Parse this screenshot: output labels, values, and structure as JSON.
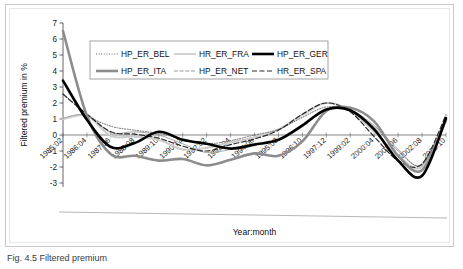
{
  "figure": {
    "caption": "Fig. 4.5   Filtered premium"
  },
  "chart_data": {
    "type": "line",
    "title": "",
    "xlabel": "Year:month",
    "ylabel": "Filtered premium in %",
    "ylim": [
      -3,
      7
    ],
    "yticks": [
      -3,
      -2,
      -1,
      0,
      1,
      2,
      3,
      4,
      5,
      6,
      7
    ],
    "ytick_labels": [
      "-3",
      "-2",
      "-1",
      "0",
      "1",
      "2",
      "3",
      "4",
      "5",
      "6",
      "7"
    ],
    "grid": false,
    "legend_position": "top-center",
    "x": [
      "1985:02",
      "1986:04",
      "1987:06",
      "1988:08",
      "1989:10",
      "1990:12",
      "1992:02",
      "1993:04",
      "1994:06",
      "1995:08",
      "1996:10",
      "1997:12",
      "1999:02",
      "2000:04",
      "2001:06",
      "2002:08",
      "2003:10"
    ],
    "xtick_labels": [
      "1985:02",
      "1986:04",
      "1987:06",
      "1988:08",
      "1989:10",
      "1990:12",
      "1992:02",
      "1993:04",
      "1994:06",
      "1995:08",
      "1996:10",
      "1997:12",
      "1999:02",
      "2000:04",
      "2001:06",
      "2002:08",
      "2003:10"
    ],
    "series": [
      {
        "name": "HP_ER_BEL",
        "style": "dotted",
        "color": "#6b6b6b",
        "width": 1,
        "values": [
          2.6,
          1.25,
          0.55,
          0.3,
          0.1,
          -0.25,
          -0.55,
          -0.35,
          0.0,
          0.35,
          1.1,
          1.75,
          1.5,
          0.5,
          -1.0,
          -1.85,
          1.1
        ]
      },
      {
        "name": "HR_ER_FRA",
        "style": "solid",
        "color": "#a6a6a6",
        "width": 1,
        "values": [
          1.05,
          1.25,
          0.15,
          0.2,
          0.0,
          -0.55,
          -1.1,
          -0.9,
          -0.6,
          -0.35,
          0.5,
          1.6,
          1.55,
          0.6,
          -0.9,
          -1.9,
          1.0
        ]
      },
      {
        "name": "HP_ER_GER",
        "style": "solid",
        "color": "#000000",
        "width": 2.6,
        "values": [
          3.4,
          0.95,
          -0.75,
          -0.5,
          0.2,
          -0.3,
          -0.55,
          -0.85,
          -0.6,
          -0.3,
          0.6,
          1.6,
          1.55,
          0.35,
          -1.6,
          -2.55,
          1.05
        ]
      },
      {
        "name": "HP_ER_ITA",
        "style": "solid",
        "color": "#8c8c8c",
        "width": 2.6,
        "values": [
          6.5,
          1.2,
          -1.2,
          -1.3,
          -1.6,
          -1.5,
          -1.9,
          -1.55,
          -1.15,
          -1.3,
          -0.4,
          1.5,
          1.7,
          0.85,
          -1.3,
          -2.2,
          0.95
        ]
      },
      {
        "name": "HP_ER_NET",
        "style": "dashed-light",
        "color": "#cccccc",
        "width": 2.2,
        "values": [
          1.0,
          1.2,
          -0.05,
          -0.1,
          -0.3,
          -0.9,
          -0.8,
          -0.45,
          -0.15,
          0.35,
          1.25,
          2.0,
          1.5,
          0.2,
          -1.3,
          -2.0,
          0.85
        ]
      },
      {
        "name": "HR_ER_SPA",
        "style": "dashed",
        "color": "#2b2b2b",
        "width": 1.2,
        "values": [
          2.55,
          1.3,
          0.2,
          0.05,
          -0.2,
          -0.7,
          -1.0,
          -0.6,
          -0.25,
          0.3,
          1.3,
          2.0,
          1.45,
          -0.1,
          -1.6,
          -1.8,
          1.25
        ]
      }
    ],
    "legend": [
      {
        "label": "HP_ER_BEL",
        "style": "dotted",
        "color": "#6b6b6b",
        "width": 1
      },
      {
        "label": "HR_ER_FRA",
        "style": "solid",
        "color": "#a6a6a6",
        "width": 1
      },
      {
        "label": "HP_ER_GER",
        "style": "solid",
        "color": "#000000",
        "width": 2.6
      },
      {
        "label": "HP_ER_ITA",
        "style": "solid",
        "color": "#8c8c8c",
        "width": 2.6
      },
      {
        "label": "HP_ER_NET",
        "style": "dashed-light",
        "color": "#cccccc",
        "width": 2.2
      },
      {
        "label": "HR_ER_SPA",
        "style": "dashed",
        "color": "#2b2b2b",
        "width": 1.2
      }
    ]
  }
}
